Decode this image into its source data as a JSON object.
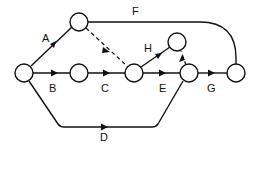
{
  "diagram": {
    "type": "activity-on-arrow network",
    "nodes": [
      {
        "id": "n1",
        "x": 24,
        "y": 73
      },
      {
        "id": "n2",
        "x": 79,
        "y": 22
      },
      {
        "id": "n3",
        "x": 79,
        "y": 73
      },
      {
        "id": "n4",
        "x": 134,
        "y": 73
      },
      {
        "id": "n5",
        "x": 177,
        "y": 42
      },
      {
        "id": "n6",
        "x": 189,
        "y": 73
      },
      {
        "id": "n7",
        "x": 236,
        "y": 73
      }
    ],
    "edges": [
      {
        "label": "A",
        "from": "n1",
        "to": "n2"
      },
      {
        "label": "B",
        "from": "n1",
        "to": "n3"
      },
      {
        "label": "C",
        "from": "n3",
        "to": "n4"
      },
      {
        "label": "D",
        "from": "n1",
        "to": "n6"
      },
      {
        "label": "E",
        "from": "n4",
        "to": "n6"
      },
      {
        "label": "F",
        "from": "n2",
        "to": "n7"
      },
      {
        "label": "G",
        "from": "n6",
        "to": "n7"
      },
      {
        "label": "H",
        "from": "n4",
        "to": "n5"
      },
      {
        "label": "",
        "from": "n2",
        "to": "n4",
        "dummy": true
      },
      {
        "label": "",
        "from": "n6",
        "to": "n5",
        "dummy": true
      }
    ],
    "labels": {
      "A": "A",
      "B": "B",
      "C": "C",
      "D": "D",
      "E": "E",
      "F": "F",
      "G": "G",
      "H": "H"
    }
  }
}
